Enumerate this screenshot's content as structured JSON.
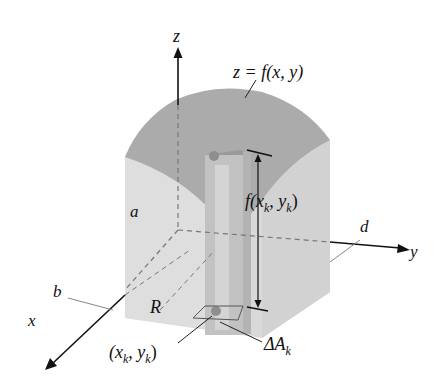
{
  "figure": {
    "labels": {
      "z_axis": "z",
      "x_axis": "x",
      "y_axis": "y",
      "surface": "z = f(x, y)",
      "height": "f(x",
      "height_sub1": "k",
      "height_mid": ", y",
      "height_sub2": "k",
      "height_end": ")",
      "a": "a",
      "b": "b",
      "d": "d",
      "region": "R",
      "point_open": "(x",
      "point_sub1": "k",
      "point_mid": ", y",
      "point_sub2": "k",
      "point_close": ")",
      "area_delta": "ΔA",
      "area_sub": "k"
    },
    "colors": {
      "surface_top": "#a9a9a9",
      "front_face": "#d6d6d6",
      "side_face": "#c4c4c4",
      "column": "#bdbdbd",
      "axis": "#111111",
      "dashed": "#777777"
    }
  }
}
